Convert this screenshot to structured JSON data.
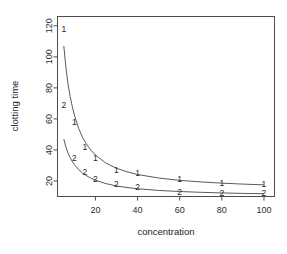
{
  "chart_data": {
    "type": "scatter",
    "title": "",
    "subtitle": "",
    "xlabel": "concentration",
    "ylabel": "clotting time",
    "xlim": [
      2,
      105
    ],
    "ylim": [
      10,
      126
    ],
    "xticks": [
      20,
      40,
      60,
      80,
      100
    ],
    "yticks": [
      20,
      40,
      60,
      80,
      100,
      120
    ],
    "xtick_labels": [
      "20",
      "40",
      "60",
      "80",
      "100"
    ],
    "ytick_labels": [
      "20",
      "40",
      "60",
      "80",
      "100",
      "120"
    ],
    "grid": false,
    "legend": "none",
    "point_marker_style": "group-number-glyph",
    "box": true,
    "series": [
      {
        "name": "1",
        "marker_label": "1",
        "x": [
          5,
          10,
          15,
          20,
          30,
          40,
          60,
          80,
          100
        ],
        "y": [
          118,
          58,
          42,
          35,
          27,
          25,
          21,
          19,
          18
        ]
      },
      {
        "name": "2",
        "marker_label": "2",
        "x": [
          5,
          10,
          15,
          20,
          30,
          40,
          60,
          80,
          100
        ],
        "y": [
          69,
          35,
          26,
          21,
          18,
          16,
          13,
          12,
          12
        ]
      }
    ],
    "fitted_curves": [
      {
        "name": "fit-1",
        "for_series": "1",
        "x": [
          5,
          6,
          7,
          8,
          9,
          10,
          12,
          14,
          16,
          18,
          20,
          25,
          30,
          35,
          40,
          50,
          60,
          70,
          80,
          90,
          100
        ],
        "y": [
          107.0,
          93.0,
          82.5,
          74.5,
          68.0,
          62.5,
          54.0,
          47.8,
          43.2,
          39.6,
          36.7,
          31.5,
          28.2,
          25.9,
          24.2,
          21.9,
          20.4,
          19.4,
          18.6,
          18.0,
          17.5
        ]
      },
      {
        "name": "fit-2",
        "for_series": "2",
        "x": [
          5,
          6,
          7,
          8,
          9,
          10,
          12,
          14,
          16,
          18,
          20,
          25,
          30,
          35,
          40,
          50,
          60,
          70,
          80,
          90,
          100
        ],
        "y": [
          47.0,
          41.8,
          38.0,
          35.0,
          32.6,
          30.6,
          27.4,
          25.0,
          23.2,
          21.7,
          20.5,
          18.3,
          16.8,
          15.8,
          15.0,
          13.9,
          13.2,
          12.7,
          12.3,
          12.0,
          11.8
        ]
      }
    ]
  },
  "axes": {
    "x_axis_name": "concentration-axis",
    "y_axis_name": "clotting-time-axis"
  },
  "colors": {
    "background": "#ffffff",
    "axis": "#4d4d4d",
    "curve": "#5a5a5a",
    "text": "#1a1a1a"
  }
}
